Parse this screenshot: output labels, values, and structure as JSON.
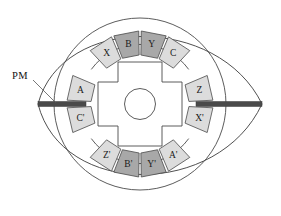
{
  "figure": {
    "background_color": "#ffffff",
    "annotations": [
      {
        "name": "pm-label",
        "text": "PM",
        "x": 12,
        "y": 75
      }
    ],
    "magnet": {
      "name": "permanent-magnet-bar",
      "color": "#4a4a4a",
      "x1": 38,
      "x2": 262,
      "y": 104,
      "thickness": 5
    },
    "rotor": {
      "name": "salient-pole-rotor",
      "poles": 4,
      "center_x": 140,
      "center_y": 104,
      "hub_radius": 15,
      "pole_tip_radius": 44,
      "fill": "#ffffff",
      "stroke": "#4a4a4a"
    },
    "stator": {
      "name": "stator-ring",
      "center_x": 140,
      "center_y": 104,
      "outer_radius": 86,
      "inner_radius": 50,
      "stroke": "#4a4a4a"
    },
    "housing": {
      "name": "lens-housing-outline",
      "left_vertex_x": 38,
      "right_vertex_x": 262,
      "vertex_y": 104,
      "top_y": 12,
      "bottom_y": 196,
      "stroke": "#3c3c3c"
    },
    "colors": {
      "coil_light": "#dcdcdc",
      "coil_dark": "#a8a8a8",
      "outline": "#4a4a4a",
      "magnet": "#4a4a4a",
      "text": "#1a1a1a",
      "background": "#ffffff"
    },
    "coils": [
      {
        "name": "coil-x",
        "label": "X",
        "angle": 123,
        "shade": "light"
      },
      {
        "name": "coil-b",
        "label": "B",
        "angle": 101,
        "shade": "dark"
      },
      {
        "name": "coil-y",
        "label": "Y",
        "angle": 79,
        "shade": "dark"
      },
      {
        "name": "coil-c",
        "label": "C",
        "angle": 57,
        "shade": "light"
      },
      {
        "name": "coil-z",
        "label": "Z",
        "angle": 13,
        "shade": "light"
      },
      {
        "name": "coil-x-prime",
        "label": "X'",
        "angle": -13,
        "shade": "light"
      },
      {
        "name": "coil-a-prime",
        "label": "A'",
        "angle": -57,
        "shade": "light"
      },
      {
        "name": "coil-y-prime",
        "label": "Y'",
        "angle": -79,
        "shade": "dark"
      },
      {
        "name": "coil-b-prime",
        "label": "B'",
        "angle": -101,
        "shade": "dark"
      },
      {
        "name": "coil-z-prime",
        "label": "Z'",
        "angle": -123,
        "shade": "light"
      },
      {
        "name": "coil-c-prime",
        "label": "C'",
        "angle": 193,
        "shade": "light"
      },
      {
        "name": "coil-a",
        "label": "A",
        "angle": 167,
        "shade": "light"
      }
    ]
  }
}
